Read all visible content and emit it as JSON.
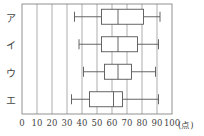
{
  "chart_data": {
    "type": "boxplot",
    "orientation": "horizontal",
    "title": "",
    "xlabel": "",
    "x_unit": "(点)",
    "ylabel": "",
    "xlim": [
      0,
      100
    ],
    "x_ticks": [
      "0",
      "10",
      "20",
      "30",
      "40",
      "50",
      "60",
      "70",
      "80",
      "90",
      "100"
    ],
    "grid": "vertical",
    "categories": [
      "ア",
      "イ",
      "ウ",
      "エ"
    ],
    "series": [
      {
        "name": "ア",
        "min": 35,
        "q1": 53,
        "median": 64,
        "q3": 81,
        "max": 92
      },
      {
        "name": "イ",
        "min": 38,
        "q1": 53,
        "median": 64,
        "q3": 77,
        "max": 91
      },
      {
        "name": "ウ",
        "min": 41,
        "q1": 55,
        "median": 64,
        "q3": 73,
        "max": 89
      },
      {
        "name": "エ",
        "min": 33,
        "q1": 45,
        "median": 61,
        "q3": 67,
        "max": 91
      }
    ]
  },
  "colors": {
    "line": "#555555",
    "grid": "#777777",
    "text": "#444444"
  }
}
